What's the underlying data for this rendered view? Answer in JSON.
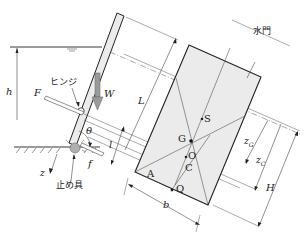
{
  "diagram": {
    "type": "engineering-diagram",
    "colors": {
      "line": "#222222",
      "gate_fill": "#ebebeb",
      "weight_arrow": "#9a9a9a",
      "stopper_fill": "#b0b0b0",
      "dim_line": "#444444"
    },
    "labels": {
      "gate": "水門",
      "hinge": "ヒンジ",
      "stopper": "止め具",
      "h": "h",
      "F": "F",
      "W": "W",
      "L": "L",
      "theta": "θ",
      "l": "l",
      "f": "f",
      "z": "z",
      "S": "S",
      "G": "G",
      "O": "O",
      "C": "C",
      "A": "A",
      "Q": "Q",
      "b": "b",
      "zG_base": "z",
      "zG_sub": "G",
      "zC_base": "z",
      "zC_sub": "C",
      "H": "H"
    }
  }
}
